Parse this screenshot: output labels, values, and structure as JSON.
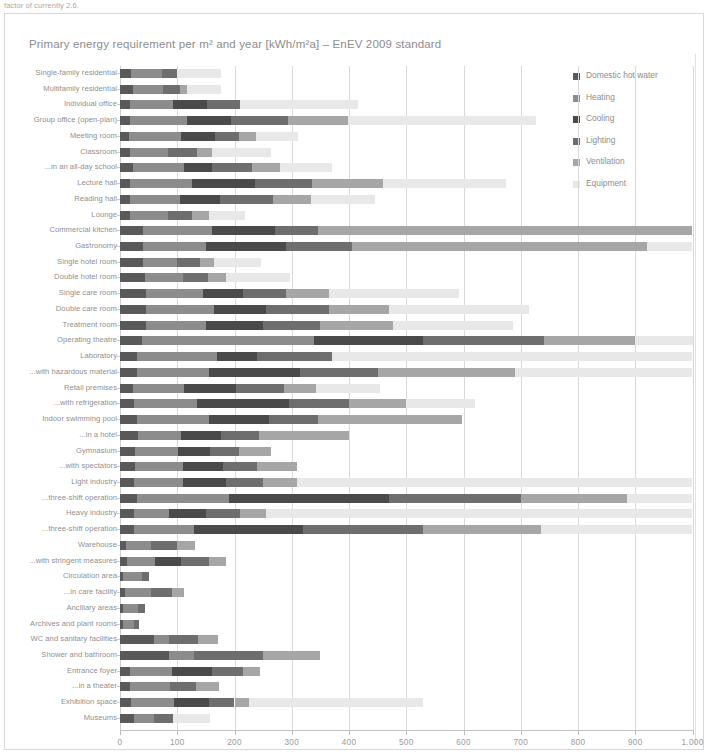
{
  "caption_fragment": "factor of currently 2.6.",
  "chart_data": {
    "type": "bar",
    "orientation": "horizontal",
    "stacked": true,
    "title": "Primary energy requirement per m² and year [kWh/m²a] – EnEV 2009 standard",
    "xlabel": "",
    "ylabel": "",
    "xlim": [
      0,
      1000
    ],
    "xticks": [
      0,
      100,
      200,
      300,
      400,
      500,
      600,
      700,
      800,
      900,
      1000
    ],
    "xtick_labels": [
      "0",
      "100",
      "200",
      "300",
      "400",
      "500",
      "600",
      "700",
      "800",
      "900",
      "1.000"
    ],
    "grid": "vertical",
    "legend_position": "right",
    "series_colors": {
      "Domestic hot water": "#595959",
      "Heating": "#8c8c8c",
      "Cooling": "#4a4a4a",
      "Lighting": "#6e6e6e",
      "Ventilation": "#a6a6a6",
      "Equipment": "#e8e8e8"
    },
    "series": [
      {
        "name": "Domestic hot water",
        "color": "#595959"
      },
      {
        "name": "Heating",
        "color": "#8c8c8c"
      },
      {
        "name": "Cooling",
        "color": "#4a4a4a"
      },
      {
        "name": "Lighting",
        "color": "#6e6e6e"
      },
      {
        "name": "Ventilation",
        "color": "#a6a6a6"
      },
      {
        "name": "Equipment",
        "color": "#e8e8e8"
      }
    ],
    "categories": [
      "Single-family residential",
      "Multifamily residential",
      "Individual office",
      "Group office (open-plan)",
      "Meeting room",
      "Classroom",
      "...in an all-day school",
      "Lecture hall",
      "Reading hall",
      "Lounge",
      "Commercial kitchen",
      "Gastronomy",
      "Single hotel room",
      "Double hotel room",
      "Single care room",
      "Double care room",
      "Treatment room",
      "Operating theatre",
      "Laboratory",
      "...with hazardous material",
      "Retail premises",
      "...with refrigeration",
      "Indoor swimming pool",
      "...in a hotel",
      "Gymnasium",
      "...with spectators",
      "Light industry",
      "...three-shift operation",
      "Heavy industry",
      "...three-shift operation",
      "Warehouse",
      "...with stringent measures",
      "Circulation area",
      "...in care facility",
      "Ancillary areas",
      "Archives and plant rooms",
      "WC and sanitary facilities",
      "Shower and bathroom",
      "Entrance foyer",
      "...in a theater",
      "Exhibition space",
      "Museums"
    ],
    "values": [
      {
        "category": "Single-family residential",
        "segments": [
          20,
          53,
          0,
          27,
          0,
          77
        ],
        "total": 177
      },
      {
        "category": "Multifamily residential",
        "segments": [
          22,
          53,
          0,
          29,
          13,
          60
        ],
        "total": 177
      },
      {
        "category": "Individual office",
        "segments": [
          17,
          75,
          60,
          57,
          0,
          207
        ],
        "total": 416
      },
      {
        "category": "Group office (open-plan)",
        "segments": [
          17,
          100,
          77,
          100,
          105,
          328
        ],
        "total": 727
      },
      {
        "category": "Meeting room",
        "segments": [
          16,
          90,
          60,
          41,
          30,
          74
        ],
        "total": 311
      },
      {
        "category": "Classroom",
        "segments": [
          18,
          65,
          0,
          52,
          26,
          102
        ],
        "total": 263
      },
      {
        "category": "...in an all-day school",
        "segments": [
          23,
          88,
          50,
          70,
          49,
          90
        ],
        "total": 370
      },
      {
        "category": "Lecture hall",
        "segments": [
          17,
          108,
          110,
          100,
          125,
          215
        ],
        "total": 675
      },
      {
        "category": "Reading hall",
        "segments": [
          17,
          88,
          70,
          92,
          67,
          111
        ],
        "total": 445
      },
      {
        "category": "Lounge",
        "segments": [
          17,
          66,
          0,
          43,
          30,
          63
        ],
        "total": 219
      },
      {
        "category": "Commercial kitchen",
        "segments": [
          40,
          120,
          110,
          75,
          655,
          0
        ],
        "total": 1000
      },
      {
        "category": "Gastronomy",
        "segments": [
          40,
          110,
          140,
          115,
          515,
          80
        ],
        "total": 1000
      },
      {
        "category": "Single hotel room",
        "segments": [
          40,
          60,
          0,
          40,
          25,
          81
        ],
        "total": 246
      },
      {
        "category": "Double hotel room",
        "segments": [
          43,
          67,
          0,
          43,
          32,
          112
        ],
        "total": 297
      },
      {
        "category": "Single care room",
        "segments": [
          45,
          100,
          70,
          75,
          75,
          227
        ],
        "total": 592
      },
      {
        "category": "Double care room",
        "segments": [
          45,
          120,
          90,
          110,
          105,
          245
        ],
        "total": 715
      },
      {
        "category": "Treatment room",
        "segments": [
          45,
          105,
          100,
          100,
          127,
          210
        ],
        "total": 687
      },
      {
        "category": "Operating theatre",
        "segments": [
          38,
          300,
          192,
          210,
          160,
          100
        ],
        "total": 1000
      },
      {
        "category": "Laboratory",
        "segments": [
          30,
          140,
          70,
          130,
          0,
          630
        ],
        "total": 1000
      },
      {
        "category": "...with hazardous material",
        "segments": [
          30,
          125,
          160,
          135,
          240,
          310
        ],
        "total": 1000
      },
      {
        "category": "Retail premises",
        "segments": [
          22,
          90,
          90,
          85,
          55,
          113
        ],
        "total": 455
      },
      {
        "category": "...with refrigeration",
        "segments": [
          25,
          110,
          160,
          105,
          100,
          120
        ],
        "total": 620
      },
      {
        "category": "Indoor swimming pool",
        "segments": [
          30,
          125,
          105,
          85,
          252,
          0
        ],
        "total": 597
      },
      {
        "category": "...in a hotel",
        "segments": [
          32,
          75,
          70,
          65,
          158,
          0
        ],
        "total": 400
      },
      {
        "category": "Gymnasium",
        "segments": [
          26,
          76,
          55,
          50,
          56,
          0
        ],
        "total": 263
      },
      {
        "category": "...with spectators",
        "segments": [
          26,
          84,
          70,
          60,
          70,
          0
        ],
        "total": 310
      },
      {
        "category": "Light industry",
        "segments": [
          25,
          85,
          75,
          65,
          60,
          690
        ],
        "total": 1000
      },
      {
        "category": "...three-shift operation",
        "segments": [
          30,
          160,
          280,
          230,
          185,
          115
        ],
        "total": 1000
      },
      {
        "category": "Heavy industry",
        "segments": [
          25,
          60,
          65,
          60,
          45,
          745
        ],
        "total": 1000
      },
      {
        "category": "...three-shift operation",
        "segments": [
          25,
          105,
          190,
          210,
          205,
          265
        ],
        "total": 1000
      },
      {
        "category": "Warehouse",
        "segments": [
          10,
          45,
          0,
          44,
          32,
          0
        ],
        "total": 131
      },
      {
        "category": "...with stringent measures",
        "segments": [
          12,
          50,
          45,
          48,
          30,
          0
        ],
        "total": 185
      },
      {
        "category": "Circulation area",
        "segments": [
          6,
          32,
          0,
          12,
          0,
          0
        ],
        "total": 50
      },
      {
        "category": "...in care facility",
        "segments": [
          8,
          47,
          0,
          35,
          22,
          0
        ],
        "total": 112
      },
      {
        "category": "Ancillary areas",
        "segments": [
          6,
          26,
          0,
          12,
          0,
          0
        ],
        "total": 44
      },
      {
        "category": "Archives and plant rooms",
        "segments": [
          5,
          20,
          0,
          8,
          0,
          0
        ],
        "total": 33
      },
      {
        "category": "WC and sanitary facilities",
        "segments": [
          60,
          26,
          0,
          50,
          35,
          0
        ],
        "total": 171
      },
      {
        "category": "Shower and bathroom",
        "segments": [
          85,
          45,
          0,
          120,
          100,
          0
        ],
        "total": 350
      },
      {
        "category": "Entrance foyer",
        "segments": [
          18,
          72,
          70,
          55,
          30,
          0
        ],
        "total": 245
      },
      {
        "category": "...in a theater",
        "segments": [
          18,
          70,
          0,
          45,
          40,
          0
        ],
        "total": 173
      },
      {
        "category": "Exhibition space",
        "segments": [
          20,
          75,
          60,
          45,
          25,
          305
        ],
        "total": 530
      },
      {
        "category": "Museums",
        "segments": [
          25,
          35,
          0,
          32,
          0,
          65
        ],
        "total": 157
      }
    ]
  }
}
